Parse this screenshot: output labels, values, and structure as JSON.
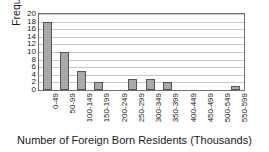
{
  "chart_data": {
    "type": "bar",
    "title": "",
    "subtitle": "",
    "xlabel": "Number of Foreign Born Residents (Thousands)",
    "ylabel": "Frequency",
    "categories": [
      "0-49",
      "50-99",
      "100-149",
      "150-199",
      "200-249",
      "250-299",
      "300-349",
      "350-399",
      "400-449",
      "450-499",
      "500-549",
      "550-599"
    ],
    "values": [
      18,
      10,
      5,
      2,
      0,
      3,
      3,
      2,
      0,
      0,
      0,
      1
    ],
    "ylim": [
      0,
      20
    ],
    "yticks": [
      0,
      2,
      4,
      6,
      8,
      10,
      12,
      14,
      16,
      18,
      20
    ],
    "ytick_labels": [
      "0",
      "2",
      "4",
      "6",
      "8",
      "10",
      "12",
      "14",
      "16",
      "18",
      "20"
    ],
    "grid": true,
    "grid_axis": "y",
    "legend": false,
    "legend_position": "none",
    "annotations": [],
    "colors": {
      "bar_fill": "#a9a9a9",
      "bar_edge": "#555555",
      "gridline": "#c9c9c9",
      "frame": "#6e6e6e",
      "text": "#1a1a1a",
      "background": "#ffffff"
    }
  }
}
